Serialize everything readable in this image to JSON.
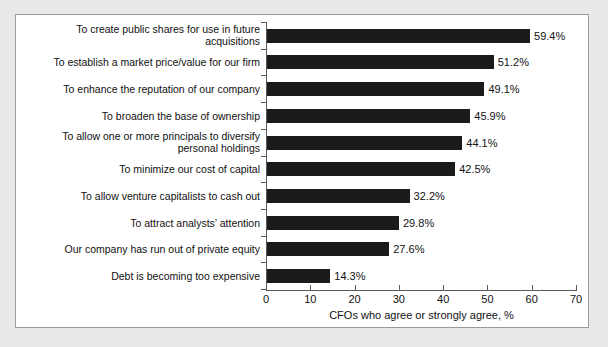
{
  "chart_data": {
    "type": "bar",
    "orientation": "horizontal",
    "title": "",
    "subtitle": "",
    "xlabel": "CFOs who agree or strongly agree, %",
    "ylabel": "",
    "xlim": [
      0,
      70
    ],
    "xticks": [
      0,
      10,
      20,
      30,
      40,
      50,
      60,
      70
    ],
    "grid": false,
    "legend": null,
    "bar_color": "#1b1b1b",
    "categories": [
      "To create public shares for use in future\nacquisitions",
      "To establish a market price/value for our firm",
      "To enhance the reputation of our company",
      "To broaden the base of ownership",
      "To allow one or more principals to diversify\npersonal holdings",
      "To minimize our cost of capital",
      "To allow venture capitalists to cash out",
      "To attract analysts’ attention",
      "Our company has run out of private equity",
      "Debt is becoming too expensive"
    ],
    "values": [
      59.4,
      51.2,
      49.1,
      45.9,
      44.1,
      42.5,
      32.2,
      29.8,
      27.6,
      14.3
    ],
    "value_labels": [
      "59.4%",
      "51.2%",
      "49.1%",
      "45.9%",
      "44.1%",
      "42.5%",
      "32.2%",
      "29.8%",
      "27.6%",
      "14.3%"
    ]
  },
  "colors": {
    "page_background": "#e9e9e9",
    "panel_background": "#ffffff",
    "panel_border": "#9b9b9b",
    "axis": "#5a5a5a",
    "text": "#111111",
    "bar": "#1b1b1b"
  }
}
